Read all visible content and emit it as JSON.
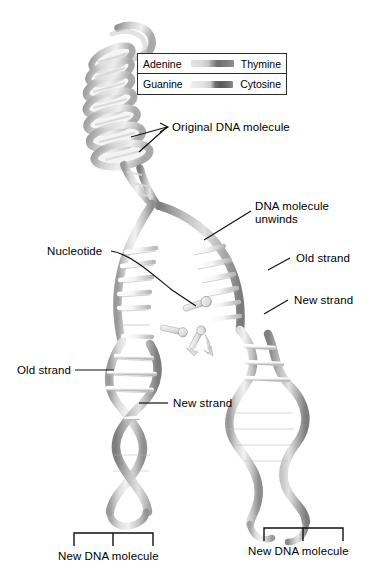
{
  "figure": {
    "background_color": "#ffffff",
    "line_color": "#111111",
    "text_color": "#000000"
  },
  "legend": {
    "rows": [
      {
        "left_label": "Adenine",
        "right_label": "Thymine",
        "bar": "adenine-thymine-bar"
      },
      {
        "left_label": "Guanine",
        "right_label": "Cytosine",
        "bar": "guanine-cytosine-bar"
      }
    ]
  },
  "labels": {
    "original_dna": "Original DNA molecule",
    "dna_unwinds_line1": "DNA molecule",
    "dna_unwinds_line2": "unwinds",
    "nucleotide": "Nucleotide",
    "old_strand_right": "Old strand",
    "new_strand_right": "New strand",
    "old_strand_left": "Old strand",
    "new_strand_left": "New strand",
    "new_dna_left": "New DNA molecule",
    "new_dna_right": "New DNA molecule"
  }
}
